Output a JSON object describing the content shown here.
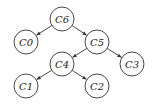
{
  "diagram": {
    "type": "tree",
    "node_radius": 12,
    "nodes": [
      {
        "id": "C6",
        "label": "C6",
        "x": 62,
        "y": 19
      },
      {
        "id": "C0",
        "label": "C0",
        "x": 26,
        "y": 42
      },
      {
        "id": "C5",
        "label": "C5",
        "x": 97,
        "y": 42
      },
      {
        "id": "C3",
        "label": "C3",
        "x": 132,
        "y": 64
      },
      {
        "id": "C4",
        "label": "C4",
        "x": 62,
        "y": 64
      },
      {
        "id": "C1",
        "label": "C1",
        "x": 26,
        "y": 86
      },
      {
        "id": "C2",
        "label": "C2",
        "x": 97,
        "y": 86
      }
    ],
    "edges": [
      {
        "from": "C6",
        "to": "C0"
      },
      {
        "from": "C6",
        "to": "C5"
      },
      {
        "from": "C5",
        "to": "C4"
      },
      {
        "from": "C5",
        "to": "C3"
      },
      {
        "from": "C4",
        "to": "C1"
      },
      {
        "from": "C4",
        "to": "C2"
      }
    ],
    "colors": {
      "stroke": "#333333",
      "fill": "#ffffff",
      "text": "#222222"
    }
  }
}
